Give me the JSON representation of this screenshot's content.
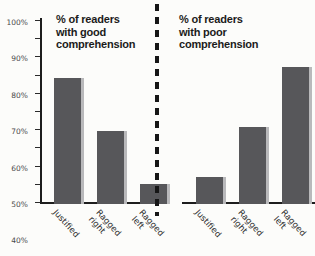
{
  "chart_data": [
    {
      "type": "bar",
      "title": "% of readers\nwith good\ncomprehension",
      "xlabel": "",
      "ylabel": "",
      "ylim": [
        0,
        100
      ],
      "grid": false,
      "legend": "none",
      "categories": [
        "Justified",
        "Ragged\nright",
        "Ragged\nleft"
      ],
      "values": [
        68,
        39,
        10
      ],
      "tick_labels": [
        "100%",
        "90%",
        "80%",
        "70%",
        "60%",
        "50%",
        "40%",
        "30%",
        "20%",
        "10%",
        "0%"
      ],
      "tick_values": [
        100,
        90,
        80,
        70,
        60,
        50,
        40,
        30,
        20,
        10,
        0
      ],
      "bar_color": "#57575a",
      "bar_shadow_color": "#b9b9bb"
    },
    {
      "type": "bar",
      "title": "% of readers\nwith poor\ncomprehension",
      "xlabel": "",
      "ylabel": "",
      "ylim": [
        0,
        100
      ],
      "grid": false,
      "legend": "none",
      "categories": [
        "Justified",
        "Ragged\nright",
        "Ragged\nleft"
      ],
      "values": [
        14,
        41,
        74
      ],
      "tick_labels": [],
      "tick_values": [
        100,
        90,
        80,
        70,
        60,
        50,
        40,
        30,
        20,
        10,
        0
      ],
      "bar_color": "#57575a",
      "bar_shadow_color": "#b9b9bb"
    }
  ],
  "left": {
    "title": "% of readers\nwith good\ncomprehension",
    "ticks": [
      {
        "label": "100%",
        "value": 100
      },
      {
        "label": "90%",
        "value": 90
      },
      {
        "label": "80%",
        "value": 80
      },
      {
        "label": "70%",
        "value": 70
      },
      {
        "label": "60%",
        "value": 60
      },
      {
        "label": "50%",
        "value": 50
      },
      {
        "label": "40%",
        "value": 40
      },
      {
        "label": "30%",
        "value": 30
      },
      {
        "label": "20%",
        "value": 20
      },
      {
        "label": "10%",
        "value": 10
      },
      {
        "label": "0%",
        "value": 0
      }
    ],
    "bars": [
      {
        "label": "Justified",
        "value": 68
      },
      {
        "label": "Ragged\nright",
        "value": 39
      },
      {
        "label": "Ragged\nleft",
        "value": 10
      }
    ]
  },
  "right": {
    "title": "% of readers\nwith poor\ncomprehension",
    "bars": [
      {
        "label": "Justified",
        "value": 14
      },
      {
        "label": "Ragged\nright",
        "value": 41
      },
      {
        "label": "Ragged\nleft",
        "value": 74
      }
    ]
  },
  "colors": {
    "bar": "#57575a",
    "bar_shadow": "#b9b9bb",
    "axis": "#1d1d1d",
    "divider": "#161616",
    "title_text": "#1b1b1b"
  }
}
